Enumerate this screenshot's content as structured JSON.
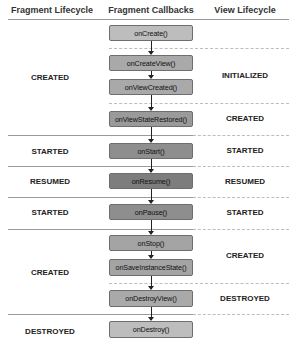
{
  "headers": {
    "fragment_lifecycle": "Fragment Lifecycle",
    "fragment_callbacks": "Fragment Callbacks",
    "view_lifecycle": "View Lifecycle"
  },
  "callbacks": [
    {
      "label": "onCreate()",
      "color": "#bdbdbd"
    },
    {
      "label": "onCreateView()",
      "color": "#a9a9a9"
    },
    {
      "label": "onViewCreated()",
      "color": "#a9a9a9"
    },
    {
      "label": "onViewStateRestored()",
      "color": "#9a9a9a"
    },
    {
      "label": "onStart()",
      "color": "#8e8e8e"
    },
    {
      "label": "onResume()",
      "color": "#7d7d7d"
    },
    {
      "label": "onPause()",
      "color": "#8e8e8e"
    },
    {
      "label": "onStop()",
      "color": "#a4a4a4"
    },
    {
      "label": "onSaveInstanceState()",
      "color": "#a4a4a4"
    },
    {
      "label": "onDestroyView()",
      "color": "#a9a9a9"
    },
    {
      "label": "onDestroy()",
      "color": "#bdbdbd"
    }
  ],
  "fragment_states": [
    {
      "label": "CREATED"
    },
    {
      "label": "STARTED"
    },
    {
      "label": "RESUMED"
    },
    {
      "label": "STARTED"
    },
    {
      "label": "CREATED"
    },
    {
      "label": "DESTROYED"
    }
  ],
  "view_states": [
    {
      "label": "INITIALIZED"
    },
    {
      "label": "CREATED"
    },
    {
      "label": "STARTED"
    },
    {
      "label": "RESUMED"
    },
    {
      "label": "STARTED"
    },
    {
      "label": "CREATED"
    },
    {
      "label": "DESTROYED"
    }
  ]
}
